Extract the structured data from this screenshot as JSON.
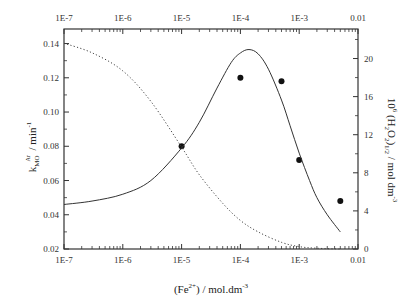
{
  "chart_data": {
    "type": "line",
    "title": "",
    "xscale": "log",
    "xlabel": "(Fe2+) / mol.dm-3",
    "xlabel_parts": {
      "pre": "(Fe",
      "sup": "2+",
      "post": ") / mol.dm",
      "sup2": "-3"
    },
    "ylabel_left": "kMO^Ar / min-1",
    "ylabel_left_parts": {
      "base": "k",
      "sub": "MO",
      "sup": "Ar",
      "post": " / min",
      "sup2": "-1"
    },
    "ylabel_right": "10^6 (H2O2)1/2 / mol dm-3",
    "ylabel_right_parts": {
      "pre": "10",
      "sup": "6",
      "mid1": " (H",
      "sub1": "2",
      "mid2": "O",
      "sub2": "2",
      "mid3": ")",
      "sub3": "1/2",
      "post": " / mol dm",
      "sup2": "-3"
    },
    "x_ticks": [
      "1E-7",
      "1E-6",
      "1E-5",
      "1E-4",
      "1E-3",
      "0.01"
    ],
    "x_tick_values": [
      1e-07,
      1e-06,
      1e-05,
      0.0001,
      0.001,
      0.01
    ],
    "xlim": [
      1e-07,
      0.01
    ],
    "y_left_ticks": [
      "0.02",
      "0.04",
      "0.06",
      "0.08",
      "0.10",
      "0.12",
      "0.14"
    ],
    "y_left_tick_values": [
      0.02,
      0.04,
      0.06,
      0.08,
      0.1,
      0.12,
      0.14
    ],
    "ylim_left": [
      0.02,
      0.1485
    ],
    "y_right_ticks": [
      "0",
      "4",
      "8",
      "12",
      "16",
      "20"
    ],
    "y_right_tick_values": [
      0,
      4,
      8,
      12,
      16,
      20
    ],
    "ylim_right": [
      0,
      23.1
    ],
    "grid": false,
    "legend": null,
    "series": [
      {
        "name": "kMO experimental",
        "style": "scatter",
        "axis": "left",
        "x": [
          1e-05,
          0.0001,
          0.0005,
          0.001,
          0.005
        ],
        "y": [
          0.08,
          0.12,
          0.118,
          0.072,
          0.048
        ]
      },
      {
        "name": "kMO model",
        "style": "solid",
        "axis": "left",
        "x": [
          1e-07,
          3e-07,
          1e-06,
          3e-06,
          1e-05,
          2e-05,
          4e-05,
          7e-05,
          0.0001,
          0.00014,
          0.0002,
          0.0003,
          0.0005,
          0.0007,
          0.001,
          0.0015,
          0.002,
          0.003,
          0.005
        ],
        "y": [
          0.046,
          0.048,
          0.052,
          0.06,
          0.079,
          0.094,
          0.114,
          0.129,
          0.1345,
          0.1365,
          0.134,
          0.125,
          0.107,
          0.092,
          0.076,
          0.06,
          0.05,
          0.04,
          0.03
        ]
      },
      {
        "name": "(H2O2)1/2",
        "style": "dotted",
        "axis": "right",
        "x": [
          1e-07,
          3e-07,
          1e-06,
          3e-06,
          1e-05,
          2e-05,
          5e-05,
          0.0001,
          0.0002,
          0.0005,
          0.001,
          0.002,
          0.005
        ],
        "y": [
          21.6,
          20.6,
          18.7,
          15.5,
          10.7,
          7.8,
          4.8,
          3.0,
          1.8,
          0.7,
          0.25,
          0.08,
          0.0
        ]
      }
    ],
    "colors": {
      "points": "#111111",
      "solid": "#333333",
      "dotted": "#444444",
      "axes": "#333333"
    }
  }
}
